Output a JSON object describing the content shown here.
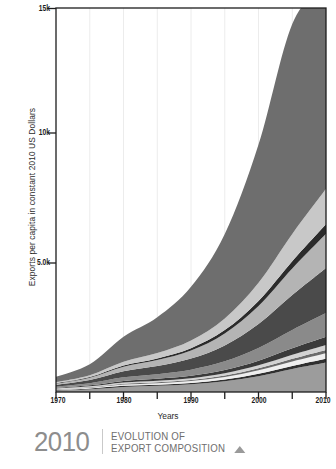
{
  "chart_data": {
    "type": "area",
    "title": "EVOLUTION OF EXPORT COMPOSITION",
    "subtitle": "",
    "xlabel": "Years",
    "ylabel": "Exports per capita in constant 2010 US Dollars",
    "xlim": [
      1970,
      2010
    ],
    "ylim": [
      0,
      15000
    ],
    "grid": true,
    "legend_position": "none",
    "stacked": true,
    "y_ticks": [
      {
        "value": 15000,
        "label": "15k"
      },
      {
        "value": 10000,
        "label": "10k"
      },
      {
        "value": 5000,
        "label": "5.0k"
      }
    ],
    "x_ticks": [
      {
        "value": 1970,
        "label": "1970",
        "major": true
      },
      {
        "value": 1975,
        "label": "",
        "major": false
      },
      {
        "value": 1980,
        "label": "1980",
        "major": true
      },
      {
        "value": 1985,
        "label": "",
        "major": false
      },
      {
        "value": 1990,
        "label": "1990",
        "major": true
      },
      {
        "value": 1995,
        "label": "",
        "major": false
      },
      {
        "value": 2000,
        "label": "2000",
        "major": true
      },
      {
        "value": 2005,
        "label": "",
        "major": false
      },
      {
        "value": 2010,
        "label": "2010",
        "major": true
      }
    ],
    "x": [
      1970,
      1975,
      1980,
      1985,
      1990,
      1995,
      2000,
      2005,
      2010
    ],
    "series": [
      {
        "name": "series-01",
        "color": "#9c9c9c",
        "values": [
          60,
          110,
          200,
          240,
          300,
          420,
          620,
          900,
          1150
        ]
      },
      {
        "name": "series-02",
        "color": "#2f2f2f",
        "values": [
          18,
          26,
          40,
          46,
          55,
          70,
          95,
          120,
          150
        ]
      },
      {
        "name": "series-03",
        "color": "#efefef",
        "values": [
          22,
          34,
          52,
          60,
          72,
          95,
          130,
          175,
          215
        ]
      },
      {
        "name": "series-04",
        "color": "#6b6b6b",
        "values": [
          14,
          20,
          32,
          38,
          45,
          58,
          78,
          102,
          128
        ]
      },
      {
        "name": "series-05",
        "color": "#d2d2d2",
        "values": [
          20,
          30,
          46,
          55,
          66,
          86,
          118,
          158,
          196
        ]
      },
      {
        "name": "series-06",
        "color": "#3a3a3a",
        "values": [
          26,
          40,
          64,
          78,
          96,
          130,
          182,
          250,
          315
        ]
      },
      {
        "name": "series-07",
        "color": "#8a8a8a",
        "values": [
          48,
          80,
          140,
          180,
          240,
          340,
          500,
          720,
          930
        ]
      },
      {
        "name": "series-08",
        "color": "#4a4a4a",
        "values": [
          70,
          125,
          235,
          315,
          430,
          620,
          930,
          1360,
          1760
        ]
      },
      {
        "name": "series-09",
        "color": "#b4b4b4",
        "values": [
          52,
          92,
          175,
          235,
          320,
          470,
          710,
          1040,
          1340
        ]
      },
      {
        "name": "series-10",
        "color": "#2b2b2b",
        "values": [
          16,
          26,
          48,
          64,
          88,
          128,
          194,
          284,
          366
        ]
      },
      {
        "name": "series-11",
        "color": "#c8c8c8",
        "values": [
          40,
          74,
          150,
          210,
          300,
          455,
          710,
          1065,
          1390
        ]
      },
      {
        "name": "series-12",
        "color": "#6e6e6e",
        "values": [
          210,
          430,
          980,
          1400,
          2100,
          3300,
          5400,
          8200,
          8060
        ]
      }
    ],
    "total_values": [
      596,
      1087,
      2162,
      2921,
      4112,
      6172,
      9667,
      14374,
      16000
    ],
    "annotations": []
  },
  "axes": {
    "y_title": "Exports per capita in constant 2010 US Dollars",
    "x_title": "Years",
    "y_tick_labels": [
      "15k",
      "10k",
      "5.0k"
    ],
    "x_tick_labels": [
      "1970",
      "1980",
      "1990",
      "2000",
      "2010"
    ]
  },
  "footer": {
    "year": "2010",
    "line1": "EVOLUTION OF",
    "line2": "EXPORT COMPOSITION",
    "marker_icon": "triangle-up-icon"
  },
  "colors": {
    "axis": "#1d1d1d",
    "frame": "#1d1d1d",
    "grid": "#e8e8e8",
    "background": "#ffffff",
    "footer_text": "#6e6e6e",
    "footer_year": "#8d8d8d"
  }
}
